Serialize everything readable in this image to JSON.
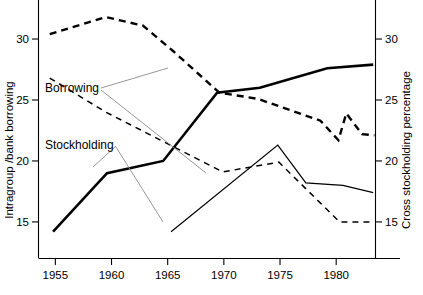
{
  "chart_data": {
    "type": "line",
    "title": "",
    "xlabel": "",
    "ylabel": "Intragroup /bank borrowing",
    "ylabel_right": "Cross stockholding percentage",
    "grid": false,
    "legend_position": "inline-annotations",
    "xlim": [
      1953.5,
      1983.5
    ],
    "xticks": [
      1955,
      1960,
      1965,
      1970,
      1975,
      1980
    ],
    "xticklabels": [
      "1955",
      "1960",
      "1965",
      "1970",
      "1975",
      "1980"
    ],
    "ylim": [
      12.0,
      33.2
    ],
    "yticks": [
      15,
      20,
      25,
      30
    ],
    "yticklabels": [
      "15",
      "20",
      "25",
      "30"
    ],
    "ylim_right": [
      12.0,
      33.2
    ],
    "yticks_right": [
      15,
      20,
      25,
      30
    ],
    "yticklabels_right": [
      "15",
      "20",
      "25",
      "30"
    ],
    "series": [
      {
        "name": "Borrowing (intragroup/bank, left axis)",
        "axis": "left",
        "style": "solid",
        "weight": "thick",
        "x": [
          1954.8,
          1959.6,
          1964.6,
          1969.4,
          1973.2,
          1979.2,
          1983.3
        ],
        "values": [
          14.2,
          19.0,
          20.0,
          25.6,
          26.0,
          27.6,
          27.9
        ]
      },
      {
        "name": "Borrowing (cross stockholding, right axis)",
        "axis": "right",
        "style": "dashed",
        "weight": "thick",
        "x": [
          1954.5,
          1959.5,
          1962.8,
          1965.5,
          1969.6,
          1973.0,
          1978.6,
          1980.2,
          1980.9,
          1982.3,
          1983.4
        ],
        "values": [
          30.4,
          31.8,
          31.1,
          29.0,
          25.6,
          25.1,
          23.3,
          21.7,
          23.9,
          22.2,
          22.1
        ]
      },
      {
        "name": "Stockholding (intragroup/bank, left axis)",
        "axis": "left",
        "style": "solid",
        "weight": "thin",
        "x": [
          1965.3,
          1974.8,
          1977.3,
          1980.6,
          1983.3
        ],
        "values": [
          14.2,
          21.3,
          18.2,
          18.0,
          17.4
        ]
      },
      {
        "name": "Stockholding (cross stockholding, right axis)",
        "axis": "right",
        "style": "dashed",
        "weight": "thin",
        "x": [
          1954.5,
          1959.5,
          1964.6,
          1969.9,
          1974.9,
          1980.3,
          1983.4
        ],
        "values": [
          26.8,
          24.0,
          21.6,
          19.1,
          19.9,
          15.0,
          15.0
        ]
      }
    ],
    "annotations": [
      {
        "label": "Borrowing",
        "x_px": 45,
        "y_px": 92,
        "leaders": [
          [
            [
              101,
              88
            ],
            [
              168,
              68
            ]
          ],
          [
            [
              101,
              90
            ],
            [
              206,
              173
            ]
          ]
        ]
      },
      {
        "label": "Stockholding",
        "x_px": 45,
        "y_px": 149,
        "leaders": [
          [
            [
              116,
              146
            ],
            [
              93,
              167
            ]
          ],
          [
            [
              116,
              147
            ],
            [
              163,
              222
            ]
          ]
        ]
      }
    ]
  },
  "caption": {
    "cropped_text": ""
  }
}
